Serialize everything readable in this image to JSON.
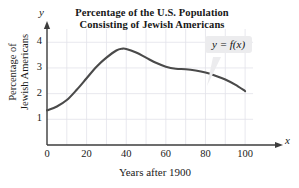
{
  "chart_data": {
    "type": "line",
    "title": "Percentage of the U.S. Population Consisting of Jewish Americans",
    "title_line1": "Percentage of the U.S. Population",
    "title_line2": "Consisting of Jewish Americans",
    "xlabel": "Years after 1900",
    "ylabel": "Percentage of Jewish Americans",
    "ylabel_line1": "Percentage of",
    "ylabel_line2": "Jewish Americans",
    "x_axis_variable": "x",
    "y_axis_variable": "y",
    "xlim": [
      0,
      105
    ],
    "ylim": [
      0,
      4.4
    ],
    "xticks": [
      0,
      20,
      40,
      60,
      80,
      100
    ],
    "xtick_labels": [
      "0",
      "20",
      "40",
      "60",
      "80",
      "100"
    ],
    "yticks": [
      1,
      2,
      3,
      4
    ],
    "ytick_labels": [
      "1",
      "2",
      "3",
      "4"
    ],
    "grid": true,
    "grid_x_step": 10,
    "grid_y_step": 1,
    "legend": "none",
    "annotation": "y = f(x)",
    "series": [
      {
        "name": "y = f(x)",
        "color": "#4a4a4a",
        "x": [
          0,
          5,
          10,
          15,
          20,
          25,
          30,
          35,
          38,
          40,
          45,
          50,
          55,
          60,
          65,
          70,
          75,
          80,
          85,
          90,
          95,
          100
        ],
        "values": [
          1.35,
          1.5,
          1.75,
          2.15,
          2.6,
          3.05,
          3.4,
          3.68,
          3.75,
          3.74,
          3.6,
          3.4,
          3.2,
          3.05,
          2.97,
          2.95,
          2.9,
          2.82,
          2.7,
          2.55,
          2.35,
          2.1
        ]
      }
    ]
  },
  "colors": {
    "curve": "#4a4a4a",
    "axis": "#3c3c3c",
    "grid": "#e2e2ea",
    "callout_background": "#ececee",
    "text": "#1a1a1a"
  }
}
